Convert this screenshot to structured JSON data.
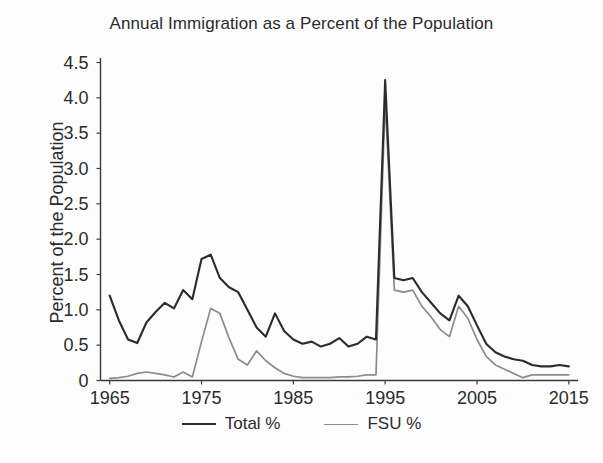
{
  "chart_data": {
    "type": "line",
    "title": "Annual Immigration as a Percent of the Population",
    "xlabel": "",
    "ylabel": "Percent of the Population",
    "xlim": [
      1964,
      2016
    ],
    "ylim": [
      0,
      4.5
    ],
    "grid": false,
    "legend_position": "bottom",
    "xticks": [
      1965,
      1975,
      1985,
      1995,
      2005,
      2015
    ],
    "xtick_labels": [
      "1965",
      "1975",
      "1985",
      "1995",
      "2005",
      "2015"
    ],
    "yticks": [
      0,
      0.5,
      1.0,
      1.5,
      2.0,
      2.5,
      3.0,
      3.5,
      4.0,
      4.5
    ],
    "ytick_labels": [
      "0",
      "0.5",
      "1.0",
      "1.5",
      "2.0",
      "2.5",
      "3.0",
      "3.5",
      "4.0",
      "4.5"
    ],
    "x": [
      1965,
      1966,
      1967,
      1968,
      1969,
      1970,
      1971,
      1972,
      1973,
      1974,
      1975,
      1976,
      1977,
      1978,
      1979,
      1980,
      1981,
      1982,
      1983,
      1984,
      1985,
      1986,
      1987,
      1988,
      1989,
      1990,
      1991,
      1992,
      1993,
      1994,
      1995,
      1996,
      1997,
      1998,
      1999,
      2000,
      2001,
      2002,
      2003,
      2004,
      2005,
      2006,
      2007,
      2008,
      2009,
      2010,
      2011,
      2012,
      2013,
      2014,
      2015
    ],
    "series": [
      {
        "name": "Total %",
        "color": "#2b2b2b",
        "values": [
          1.2,
          0.85,
          0.58,
          0.53,
          0.82,
          0.97,
          1.1,
          1.02,
          1.28,
          1.15,
          1.72,
          1.78,
          1.45,
          1.32,
          1.25,
          1.0,
          0.75,
          0.62,
          0.95,
          0.7,
          0.58,
          0.52,
          0.55,
          0.48,
          0.52,
          0.6,
          0.48,
          0.52,
          0.62,
          0.58,
          4.25,
          1.45,
          1.42,
          1.45,
          1.25,
          1.1,
          0.95,
          0.85,
          1.2,
          1.05,
          0.78,
          0.52,
          0.4,
          0.34,
          0.3,
          0.28,
          0.22,
          0.2,
          0.2,
          0.22,
          0.2
        ]
      },
      {
        "name": "FSU %",
        "color": "#8c8c8c",
        "values": [
          0.03,
          0.04,
          0.06,
          0.1,
          0.12,
          0.1,
          0.08,
          0.05,
          0.12,
          0.05,
          0.55,
          1.02,
          0.95,
          0.6,
          0.3,
          0.22,
          0.42,
          0.28,
          0.18,
          0.1,
          0.06,
          0.04,
          0.04,
          0.04,
          0.04,
          0.05,
          0.05,
          0.06,
          0.08,
          0.08,
          3.95,
          1.28,
          1.25,
          1.28,
          1.05,
          0.9,
          0.72,
          0.62,
          1.05,
          0.88,
          0.58,
          0.34,
          0.22,
          0.16,
          0.1,
          0.04,
          0.08,
          0.08,
          0.08,
          0.08,
          0.08
        ]
      }
    ],
    "peak": {
      "year": 1991,
      "total": 4.25,
      "fsu": 3.95
    }
  },
  "legend": {
    "entries": [
      {
        "label": "Total %",
        "color": "#2b2b2b"
      },
      {
        "label": "FSU %",
        "color": "#8c8c8c"
      }
    ]
  }
}
